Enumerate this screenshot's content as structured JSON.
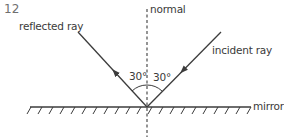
{
  "question_number": "12",
  "labels": {
    "normal": "normal",
    "reflected_ray": "reflected ray",
    "incident_ray": "incident ray",
    "mirror": "mirror",
    "angle_of_reflection": "30°",
    "angle_of_incidence": "30°"
  },
  "colors": {
    "line": "#3c3c3c",
    "text": "#3a3a3a",
    "number": "#6f6f6f"
  }
}
